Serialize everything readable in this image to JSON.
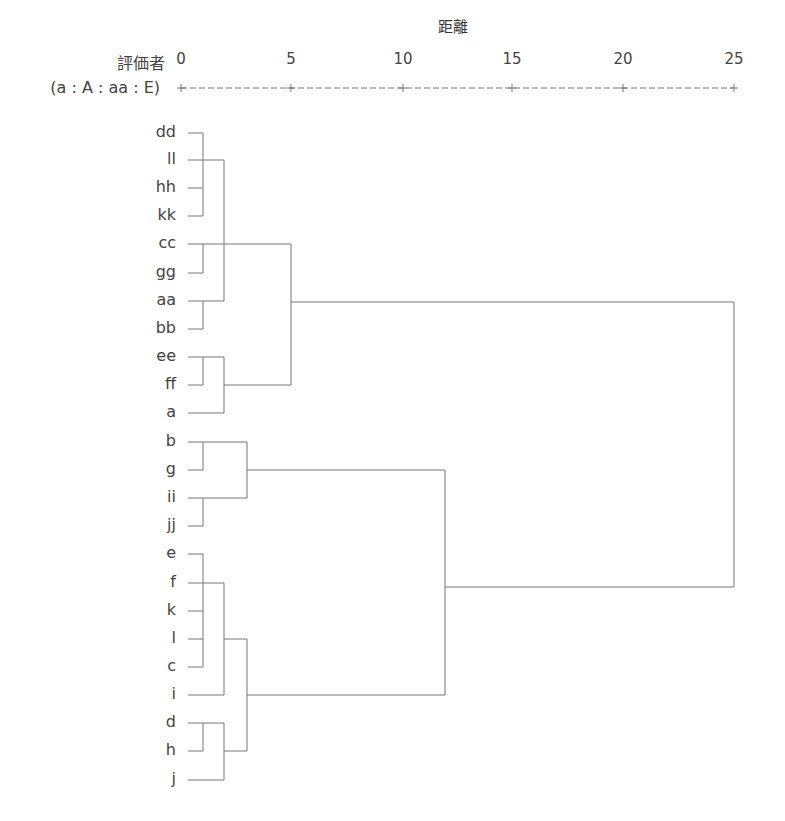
{
  "header": {
    "axis_title": "距離",
    "row_header_line1": "評価者",
    "row_header_line2": "(a : A : aa : E)",
    "axis_ruler_text": "+----------+----------+----------+----------+----------+"
  },
  "axis": {
    "ticks": [
      {
        "label": "0",
        "x": 181
      },
      {
        "label": "5",
        "x": 291
      },
      {
        "label": "10",
        "x": 403
      },
      {
        "label": "15",
        "x": 512
      },
      {
        "label": "20",
        "x": 623
      },
      {
        "label": "25",
        "x": 734
      }
    ]
  },
  "leaves": [
    {
      "label": "dd",
      "y": 133
    },
    {
      "label": "ll",
      "y": 160
    },
    {
      "label": "hh",
      "y": 188
    },
    {
      "label": "kk",
      "y": 216
    },
    {
      "label": "cc",
      "y": 244
    },
    {
      "label": "gg",
      "y": 273
    },
    {
      "label": "aa",
      "y": 301
    },
    {
      "label": "bb",
      "y": 329
    },
    {
      "label": "ee",
      "y": 357
    },
    {
      "label": "ff",
      "y": 385
    },
    {
      "label": "a",
      "y": 413
    },
    {
      "label": "b",
      "y": 442
    },
    {
      "label": "g",
      "y": 470
    },
    {
      "label": "ii",
      "y": 498
    },
    {
      "label": "jj",
      "y": 526
    },
    {
      "label": "e",
      "y": 554
    },
    {
      "label": "f",
      "y": 583
    },
    {
      "label": "k",
      "y": 611
    },
    {
      "label": "l",
      "y": 639
    },
    {
      "label": "c",
      "y": 667
    },
    {
      "label": "i",
      "y": 695
    },
    {
      "label": "d",
      "y": 723
    },
    {
      "label": "h",
      "y": 751
    },
    {
      "label": "j",
      "y": 780
    }
  ],
  "merges": [
    {
      "members": [
        "dd",
        "ll",
        "hh",
        "kk"
      ],
      "distance": 1
    },
    {
      "members": [
        "cc",
        "gg"
      ],
      "distance": 1
    },
    {
      "members": [
        "aa",
        "bb"
      ],
      "distance": 1
    },
    {
      "members": [
        "dd-kk",
        "cc-gg",
        "aa-bb"
      ],
      "distance": 2
    },
    {
      "members": [
        "ee",
        "ff"
      ],
      "distance": 1
    },
    {
      "members": [
        "ee-ff",
        "a"
      ],
      "distance": 2
    },
    {
      "members": [
        "dd..bb",
        "ee..a"
      ],
      "distance": 5
    },
    {
      "members": [
        "b",
        "g"
      ],
      "distance": 1
    },
    {
      "members": [
        "ii",
        "jj"
      ],
      "distance": 1
    },
    {
      "members": [
        "b-g",
        "ii-jj"
      ],
      "distance": 3
    },
    {
      "members": [
        "e",
        "f",
        "k",
        "l",
        "c"
      ],
      "distance": 1
    },
    {
      "members": [
        "e..c",
        "i"
      ],
      "distance": 2
    },
    {
      "members": [
        "d",
        "h"
      ],
      "distance": 1
    },
    {
      "members": [
        "d-h",
        "j"
      ],
      "distance": 2
    },
    {
      "members": [
        "e..i",
        "d..j"
      ],
      "distance": 3
    },
    {
      "members": [
        "b..jj",
        "e..j"
      ],
      "distance": 12
    },
    {
      "members": [
        "dd..a",
        "b..j"
      ],
      "distance": 25
    }
  ],
  "line_color": "#777777"
}
